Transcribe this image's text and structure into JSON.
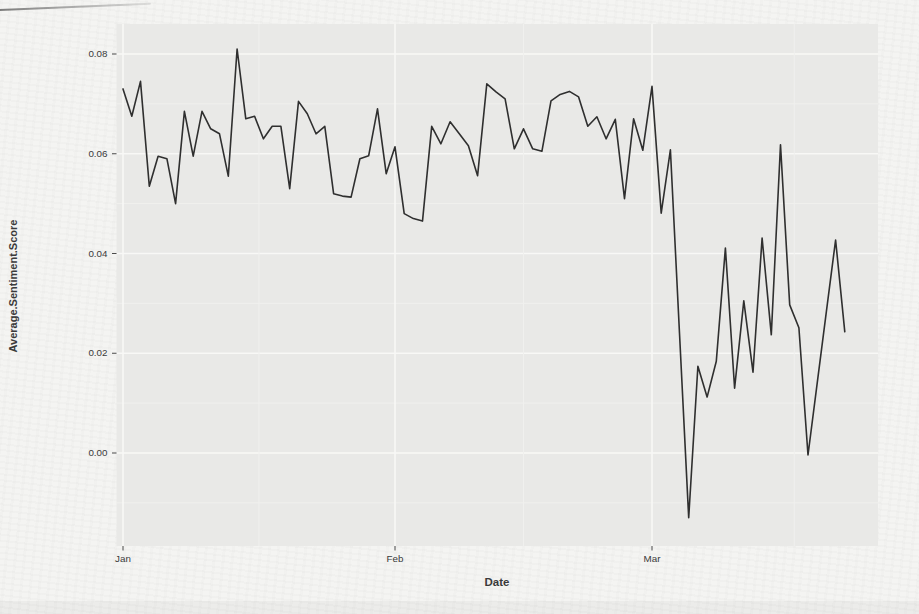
{
  "page": {
    "background_color": "#f4f4f2"
  },
  "chart_data": {
    "type": "line",
    "title": "",
    "xlabel": "Date",
    "ylabel": "Average.Sentiment.Score",
    "x_tick_labels": [
      "Jan",
      "Feb",
      "Mar"
    ],
    "y_tick_labels": [
      "0.00",
      "0.02",
      "0.04",
      "0.06",
      "0.08"
    ],
    "y_tick_values": [
      0.0,
      0.02,
      0.04,
      0.06,
      0.08
    ],
    "y_minor_values": [
      -0.01,
      0.01,
      0.03,
      0.05,
      0.07
    ],
    "ylim": [
      -0.0185,
      0.0865
    ],
    "x_range": [
      "Jan 1",
      "Mar 22"
    ],
    "grid": "major+minor",
    "legend_position": "none",
    "line_color": "#2f2f2f",
    "panel_color": "#e9e9e7",
    "grid_major_color": "#f8f8f6",
    "grid_minor_color": "#f0f0ee",
    "tick_color": "#4a4a4a",
    "text_color": "#3a3a3a",
    "series": [
      {
        "name": "Average.Sentiment.Score",
        "x": [
          "Jan 1",
          "Jan 2",
          "Jan 3",
          "Jan 4",
          "Jan 5",
          "Jan 6",
          "Jan 7",
          "Jan 8",
          "Jan 9",
          "Jan 10",
          "Jan 11",
          "Jan 12",
          "Jan 13",
          "Jan 14",
          "Jan 15",
          "Jan 16",
          "Jan 17",
          "Jan 18",
          "Jan 19",
          "Jan 20",
          "Jan 21",
          "Jan 22",
          "Jan 23",
          "Jan 24",
          "Jan 25",
          "Jan 26",
          "Jan 27",
          "Jan 28",
          "Jan 29",
          "Jan 30",
          "Jan 31",
          "Feb 1",
          "Feb 2",
          "Feb 3",
          "Feb 4",
          "Feb 5",
          "Feb 6",
          "Feb 7",
          "Feb 8",
          "Feb 9",
          "Feb 10",
          "Feb 11",
          "Feb 12",
          "Feb 13",
          "Feb 14",
          "Feb 15",
          "Feb 16",
          "Feb 17",
          "Feb 18",
          "Feb 19",
          "Feb 20",
          "Feb 21",
          "Feb 22",
          "Feb 23",
          "Feb 24",
          "Feb 25",
          "Feb 26",
          "Feb 27",
          "Feb 28",
          "Mar 1",
          "Mar 2",
          "Mar 3",
          "Mar 4",
          "Mar 5",
          "Mar 6",
          "Mar 7",
          "Mar 8",
          "Mar 9",
          "Mar 10",
          "Mar 11",
          "Mar 12",
          "Mar 13",
          "Mar 14",
          "Mar 15",
          "Mar 16",
          "Mar 17",
          "Mar 18",
          "Mar 19",
          "Mar 20",
          "Mar 21",
          "Mar 22"
        ],
        "values": [
          0.073,
          0.0675,
          0.0745,
          0.0535,
          0.0595,
          0.059,
          0.05,
          0.0685,
          0.0595,
          0.0685,
          0.065,
          0.064,
          0.0555,
          0.081,
          0.067,
          0.0675,
          0.063,
          0.0655,
          0.0655,
          0.053,
          0.0705,
          0.068,
          0.064,
          0.0655,
          0.052,
          0.0515,
          0.0513,
          0.059,
          0.0596,
          0.069,
          0.056,
          0.0614,
          0.048,
          0.047,
          0.0465,
          0.0655,
          0.062,
          0.0664,
          0.064,
          0.0616,
          0.0556,
          0.074,
          0.0724,
          0.071,
          0.061,
          0.065,
          0.061,
          0.0605,
          0.0706,
          0.0719,
          0.0725,
          0.0714,
          0.0655,
          0.0674,
          0.063,
          0.0669,
          0.051,
          0.067,
          0.0607,
          0.0735,
          0.0481,
          0.0608,
          0.024,
          -0.013,
          0.0174,
          0.0112,
          0.0184,
          0.0411,
          0.013,
          0.0305,
          0.0162,
          0.0431,
          0.0237,
          0.0618,
          0.0297,
          0.0251,
          -0.0004,
          0.014,
          0.0284,
          0.0427,
          0.0243
        ]
      }
    ]
  }
}
